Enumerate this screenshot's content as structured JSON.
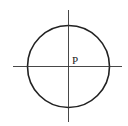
{
  "diagram": {
    "point_label": "P",
    "circle": {
      "cx": 68.5,
      "cy": 66.5,
      "r": 41
    },
    "axes": {
      "horizontal": {
        "x1": 13,
        "x2": 122,
        "y": 66.5
      },
      "vertical": {
        "x": 68.5,
        "y1": 10,
        "y2": 122
      }
    },
    "stroke_color": "#222222"
  }
}
